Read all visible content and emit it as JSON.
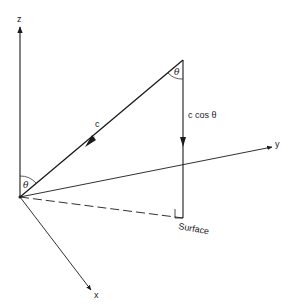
{
  "diagram": {
    "type": "3d-vector-geometry",
    "colors": {
      "line": "#1a1a1a",
      "background": "#ffffff"
    },
    "axes": {
      "z": {
        "label": "z"
      },
      "y": {
        "label": "y"
      },
      "x": {
        "label": "x"
      }
    },
    "vectors": {
      "c": {
        "label": "c"
      },
      "vertical_component": {
        "label": "c cos θ"
      }
    },
    "angles": {
      "origin_angle": {
        "label": "θ"
      },
      "apex_angle": {
        "label": "θ"
      }
    },
    "surface": {
      "label": "Surface"
    }
  }
}
